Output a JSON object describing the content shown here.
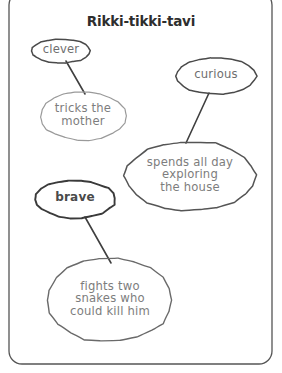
{
  "page": {
    "title": "Rikki-tikki-tavi",
    "background": "#ffffff",
    "frame_color": "#555555"
  },
  "diagram": {
    "type": "character-trait-web",
    "nodes": [
      {
        "id": "trait-clever",
        "label": "clever",
        "role": "trait",
        "shape": "ellipse",
        "cx": 61,
        "cy": 51,
        "rx": 29,
        "ry": 12,
        "stroke": "#4a4a4a",
        "stroke_width": 1.5
      },
      {
        "id": "trait-curious",
        "label": "curious",
        "role": "trait",
        "shape": "ellipse",
        "cx": 216,
        "cy": 76,
        "rx": 40,
        "ry": 18,
        "stroke": "#4a4a4a",
        "stroke_width": 1.5
      },
      {
        "id": "trait-brave",
        "label": "brave",
        "role": "trait",
        "shape": "ellipse",
        "cx": 75,
        "cy": 199,
        "rx": 40,
        "ry": 19,
        "stroke": "#3a3a3a",
        "stroke_width": 1.9
      },
      {
        "id": "evidence-tricks",
        "label": "tricks the\nmother",
        "role": "evidence",
        "shape": "ellipse",
        "cx": 83,
        "cy": 116,
        "rx": 43,
        "ry": 24,
        "stroke": "#9a9a9a",
        "stroke_width": 1.2
      },
      {
        "id": "evidence-explores",
        "label": "spends all day\nexploring\nthe house",
        "role": "evidence",
        "shape": "ellipse",
        "cx": 190,
        "cy": 176,
        "rx": 65,
        "ry": 35,
        "stroke": "#555555",
        "stroke_width": 1.5
      },
      {
        "id": "evidence-snakes",
        "label": "fights two\nsnakes who\ncould kill him",
        "role": "evidence",
        "shape": "ellipse",
        "cx": 110,
        "cy": 300,
        "rx": 62,
        "ry": 42,
        "stroke": "#6a6a6a",
        "stroke_width": 1.4
      }
    ],
    "connectors": [
      {
        "id": "link-clever-tricks",
        "from": "trait-clever",
        "to": "evidence-tricks",
        "x1": 66,
        "y1": 61,
        "x2": 85,
        "y2": 94
      },
      {
        "id": "link-curious-explores",
        "from": "trait-curious",
        "to": "evidence-explores",
        "x1": 209,
        "y1": 93,
        "x2": 186,
        "y2": 143
      },
      {
        "id": "link-brave-snakes",
        "from": "trait-brave",
        "to": "evidence-snakes",
        "x1": 85,
        "y1": 217,
        "x2": 111,
        "y2": 263
      }
    ],
    "frame": {
      "x": 9,
      "y": -8,
      "width": 263,
      "height": 372,
      "radius": 13
    }
  }
}
